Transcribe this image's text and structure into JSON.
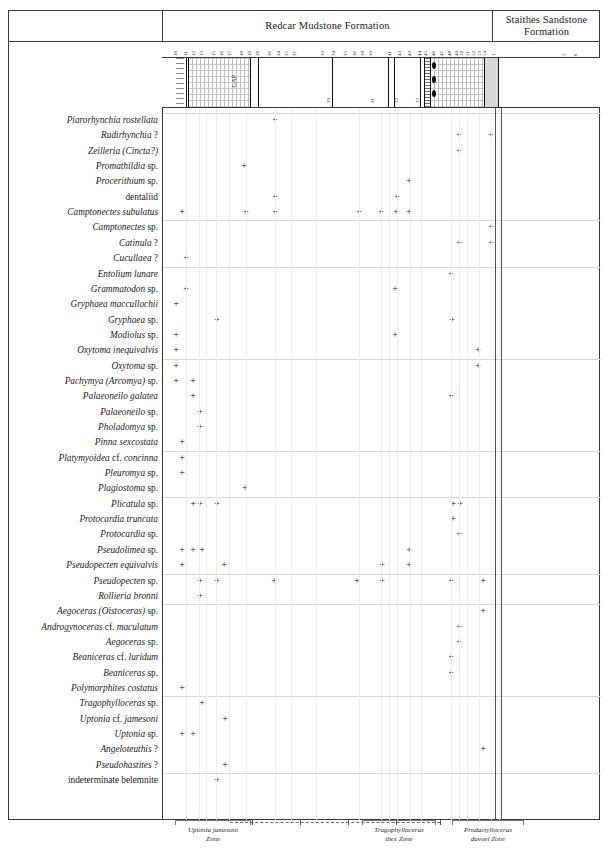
{
  "figure": {
    "type": "stratigraphic-range-chart",
    "title": ""
  },
  "formations": [
    {
      "name": "Redcar Mudstone Formation",
      "x": 162,
      "width": 330
    },
    {
      "name": "Staithes Sandstone Formation",
      "x": 492,
      "width": 108
    }
  ],
  "bed_numbers": [
    {
      "label": "10",
      "x": 178
    },
    {
      "label": "11",
      "x": 188
    },
    {
      "label": "12",
      "x": 196
    },
    {
      "label": "13",
      "x": 204
    },
    {
      "label": "15",
      "x": 216
    },
    {
      "label": "16",
      "x": 224
    },
    {
      "label": "17",
      "x": 232
    },
    {
      "label": "18",
      "x": 244
    },
    {
      "label": "19",
      "x": 252
    },
    {
      "label": "20",
      "x": 260
    },
    {
      "label": "30",
      "x": 272
    },
    {
      "label": "34",
      "x": 281
    },
    {
      "label": "35",
      "x": 289
    },
    {
      "label": "37",
      "x": 297
    },
    {
      "label": "33",
      "x": 325
    },
    {
      "label": "34",
      "x": 336
    },
    {
      "label": "35",
      "x": 348
    },
    {
      "label": "36",
      "x": 357
    },
    {
      "label": "38",
      "x": 365
    },
    {
      "label": "39",
      "x": 373
    },
    {
      "label": "41",
      "x": 392
    },
    {
      "label": "42",
      "x": 402
    },
    {
      "label": "43",
      "x": 412
    },
    {
      "label": "44",
      "x": 422
    },
    {
      "label": "45",
      "x": 428
    },
    {
      "label": "46",
      "x": 436
    },
    {
      "label": "47",
      "x": 444
    },
    {
      "label": "48",
      "x": 452
    },
    {
      "label": "49",
      "x": 459
    },
    {
      "label": "50",
      "x": 464
    },
    {
      "label": "51",
      "x": 470
    },
    {
      "label": "52",
      "x": 476
    },
    {
      "label": "53",
      "x": 482
    },
    {
      "label": "54",
      "x": 487
    },
    {
      "label": "1",
      "x": 496
    },
    {
      "label": "5",
      "x": 566
    },
    {
      "label": "6",
      "x": 578
    }
  ],
  "lithology_segments": [
    {
      "pattern": "plain",
      "x": 162,
      "width": 14
    },
    {
      "pattern": "dash",
      "x": 176,
      "width": 8
    },
    {
      "pattern": "plain",
      "x": 184,
      "width": 4
    },
    {
      "pattern": "mud",
      "x": 188,
      "width": 62
    },
    {
      "pattern": "plain",
      "x": 250,
      "width": 8
    },
    {
      "pattern": "plain",
      "x": 258,
      "width": 74
    },
    {
      "pattern": "plain",
      "x": 332,
      "width": 56
    },
    {
      "pattern": "plain",
      "x": 388,
      "width": 36
    },
    {
      "pattern": "lam",
      "x": 424,
      "width": 6
    },
    {
      "pattern": "mud",
      "x": 430,
      "width": 54
    },
    {
      "pattern": "sand",
      "x": 484,
      "width": 14
    },
    {
      "pattern": "plain",
      "x": 498,
      "width": 102
    }
  ],
  "lithology_vlines": [
    186,
    188,
    250,
    258,
    332,
    388,
    394,
    420,
    424,
    430,
    484,
    498
  ],
  "lithology_gap_label": "GAP",
  "lithology_nodules": [
    {
      "x": 432,
      "y": 4
    },
    {
      "x": 432,
      "y": 18
    },
    {
      "x": 432,
      "y": 32
    }
  ],
  "sub_numbers": [
    {
      "label": "29",
      "x": 331
    },
    {
      "label": "31",
      "x": 375
    },
    {
      "label": "32",
      "x": 399
    },
    {
      "label": "33",
      "x": 420
    }
  ],
  "column_positions": [
    {
      "id": "c01",
      "x": 185
    },
    {
      "id": "c02",
      "x": 198
    },
    {
      "id": "c03",
      "x": 205
    },
    {
      "id": "c04",
      "x": 215
    },
    {
      "id": "c05",
      "x": 228
    },
    {
      "id": "c06",
      "x": 245
    },
    {
      "id": "c07",
      "x": 274
    },
    {
      "id": "c08",
      "x": 290
    },
    {
      "id": "c09",
      "x": 315
    },
    {
      "id": "c10",
      "x": 358
    },
    {
      "id": "c11",
      "x": 380
    },
    {
      "id": "c12",
      "x": 388
    },
    {
      "id": "c13",
      "x": 396
    },
    {
      "id": "c14",
      "x": 409
    },
    {
      "id": "c15",
      "x": 420
    },
    {
      "id": "c16",
      "x": 450
    },
    {
      "id": "c17",
      "x": 458
    },
    {
      "id": "c18",
      "x": 466
    },
    {
      "id": "c19",
      "x": 478
    },
    {
      "id": "c20",
      "x": 490
    },
    {
      "id": "c21",
      "x": 498
    }
  ],
  "boundary_lines": [
    494,
    500
  ],
  "taxa": [
    {
      "name": "Piarorhynchia rostellata",
      "style": "italic",
      "marks": [
        274
      ]
    },
    {
      "name": "Rudirhynchia ?",
      "style": "italic-q",
      "marks": [
        458,
        490
      ]
    },
    {
      "name": "Zeilleria (Cincta?)",
      "style": "italic-q",
      "marks": [
        458
      ]
    },
    {
      "name": "Promathildia sp.",
      "style": "italic-sp",
      "marks": [
        243
      ]
    },
    {
      "name": "Procerithium sp.",
      "style": "italic-sp",
      "marks": [
        408
      ]
    },
    {
      "name": "dentaliid",
      "style": "roman",
      "marks": [
        274,
        396
      ]
    },
    {
      "name": "Camptonectes subulatus",
      "style": "italic",
      "marks": [
        181,
        245,
        274,
        358,
        380,
        395,
        408
      ]
    },
    {
      "name": "Camptonectes sp.",
      "style": "italic-sp",
      "marks": [
        490
      ]
    },
    {
      "name": "Catinula ?",
      "style": "italic-q",
      "marks": [
        458,
        490
      ]
    },
    {
      "name": "Cucullaea ?",
      "style": "italic-q",
      "marks": [
        185
      ]
    },
    {
      "name": "Entolium lunare",
      "style": "italic",
      "marks": [
        450
      ]
    },
    {
      "name": "Grammatodon sp.",
      "style": "italic-sp",
      "marks": [
        185,
        394
      ]
    },
    {
      "name": "Gryphaea maccullochii",
      "style": "italic",
      "marks": [
        175
      ]
    },
    {
      "name": "Gryphaea sp.",
      "style": "italic-sp",
      "marks": [
        216,
        451
      ]
    },
    {
      "name": "Modiolus sp.",
      "style": "italic-sp",
      "marks": [
        175,
        394
      ]
    },
    {
      "name": "Oxytoma inequivalvis",
      "style": "italic",
      "marks": [
        175,
        477
      ]
    },
    {
      "name": "Oxytoma sp.",
      "style": "italic-sp",
      "marks": [
        175,
        477
      ]
    },
    {
      "name": "Pachymya (Arcomya) sp.",
      "style": "italic-sp",
      "marks": [
        175,
        192
      ]
    },
    {
      "name": "Palaeoneilo galatea",
      "style": "italic",
      "marks": [
        192,
        450
      ]
    },
    {
      "name": "Palaeoneilo sp.",
      "style": "italic-sp",
      "marks": [
        199
      ]
    },
    {
      "name": "Pholadomya sp.",
      "style": "italic-sp",
      "marks": [
        199
      ]
    },
    {
      "name": "Pinna sexcostata",
      "style": "italic",
      "marks": [
        181
      ]
    },
    {
      "name": "Platymyoidea cf. concinna",
      "style": "italic-cf",
      "marks": [
        181
      ]
    },
    {
      "name": "Pleuromya sp.",
      "style": "italic-sp",
      "marks": [
        181
      ]
    },
    {
      "name": "Plagiostoma sp.",
      "style": "italic-sp",
      "marks": [
        244
      ]
    },
    {
      "name": "Plicatula sp.",
      "style": "italic-sp",
      "marks": [
        192,
        199,
        216,
        452,
        459
      ]
    },
    {
      "name": "Protocardia truncata",
      "style": "italic",
      "marks": [
        452
      ]
    },
    {
      "name": "Protocardia sp.",
      "style": "italic-sp",
      "marks": [
        458
      ]
    },
    {
      "name": "Pseudolimea sp.",
      "style": "italic-sp",
      "marks": [
        181,
        192,
        201,
        408
      ]
    },
    {
      "name": "Pseudopecten equivalvis",
      "style": "italic",
      "marks": [
        181,
        223,
        381,
        408
      ]
    },
    {
      "name": "Pseudopecten sp.",
      "style": "italic-sp",
      "marks": [
        199,
        216,
        273,
        356,
        381,
        450,
        482
      ]
    },
    {
      "name": "Rollieria bronni",
      "style": "italic",
      "marks": [
        199
      ]
    },
    {
      "name": "Aegoceras (Oistoceras) sp.",
      "style": "italic-sp",
      "marks": [
        482
      ]
    },
    {
      "name": "Androgynoceras cf. maculatum",
      "style": "italic-cf",
      "marks": [
        458
      ]
    },
    {
      "name": "Aegoceras sp.",
      "style": "italic-sp",
      "marks": [
        458
      ]
    },
    {
      "name": "Beaniceras cf. luridum",
      "style": "italic-cf",
      "marks": [
        450
      ]
    },
    {
      "name": "Beaniceras sp.",
      "style": "italic-sp",
      "marks": [
        450
      ]
    },
    {
      "name": "Polymorphites costatus",
      "style": "italic",
      "marks": [
        181
      ]
    },
    {
      "name": "Tragophylloceras sp.",
      "style": "italic-sp",
      "marks": [
        201
      ]
    },
    {
      "name": "Uptonia cf. jamesoni",
      "style": "italic-cf",
      "marks": [
        224
      ]
    },
    {
      "name": "Uptonia sp.",
      "style": "italic-sp",
      "marks": [
        181,
        192
      ]
    },
    {
      "name": "Angeloteuthis ?",
      "style": "italic-q",
      "marks": [
        482
      ]
    },
    {
      "name": "Pseudohastites ?",
      "style": "italic-q",
      "marks": [
        224
      ]
    },
    {
      "name": "indeterminate belemnite",
      "style": "roman",
      "marks": [
        216
      ]
    }
  ],
  "zones": [
    {
      "name_line1": "Uptonia jamesoni",
      "name_line2": "Zone",
      "x": 175,
      "width": 76
    },
    {
      "name_line1": "Tragophylloceras",
      "name_line2": "ibex Zone",
      "x": 362,
      "width": 74
    },
    {
      "name_line1": "Prodactylioceras",
      "name_line2": "davoei Zone",
      "x": 452,
      "width": 72
    }
  ],
  "zone_connector": {
    "dash_left": 230,
    "dash_right": 440
  }
}
